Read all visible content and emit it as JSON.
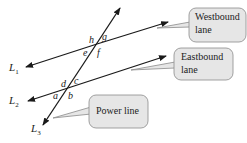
{
  "lines": {
    "L1": {
      "label": "L",
      "sub": "1"
    },
    "L2": {
      "label": "L",
      "sub": "2"
    },
    "L3": {
      "label": "L",
      "sub": "3"
    }
  },
  "angles": {
    "upper": [
      "h",
      "g",
      "e",
      "f"
    ],
    "lower": [
      "d",
      "c",
      "a",
      "b"
    ]
  },
  "callouts": {
    "westbound": [
      "Westbound",
      "lane"
    ],
    "eastbound": [
      "Eastbound",
      "lane"
    ],
    "power": [
      "Power line"
    ]
  },
  "colors": {
    "line": "#1a1a1a",
    "bubble_fill": "#e6e6e6",
    "bubble_stroke": "#8a8a8a"
  }
}
